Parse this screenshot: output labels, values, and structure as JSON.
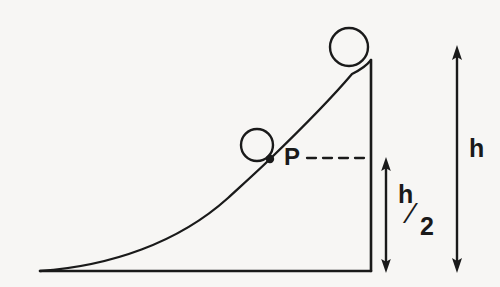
{
  "figure": {
    "background_color": "#f7f6f4",
    "ink_color": "#1a1a1a",
    "width": 500,
    "height": 287
  },
  "labels": {
    "point_p": "P",
    "height_full": "h",
    "height_half_numerator": "h",
    "height_half_slash": "⁄",
    "height_half_denominator": "2"
  },
  "geometry": {
    "baseline": {
      "x1": 40,
      "y1": 271,
      "x2": 371,
      "y2": 271
    },
    "vertical_wall": {
      "x1": 371,
      "y1": 271,
      "x2": 371,
      "y2": 60
    },
    "ramp_curve": {
      "start": {
        "x": 40,
        "y": 271
      },
      "end": {
        "x": 371,
        "y": 60
      },
      "through_point_p": {
        "x": 270,
        "y": 159
      }
    },
    "ball_top": {
      "cx": 349,
      "cy": 47,
      "r": 19
    },
    "ball_middle": {
      "cx": 257,
      "cy": 145,
      "r": 16
    },
    "point_p_dot": {
      "cx": 270,
      "cy": 159,
      "r": 4
    },
    "dashed_leader": {
      "x1": 307,
      "y1": 158,
      "x2": 370,
      "y2": 158
    },
    "dimension_h_half": {
      "x": 386,
      "y_top": 159,
      "y_bottom": 271
    },
    "dimension_h": {
      "x": 457,
      "y_top": 47,
      "y_bottom": 271
    }
  }
}
